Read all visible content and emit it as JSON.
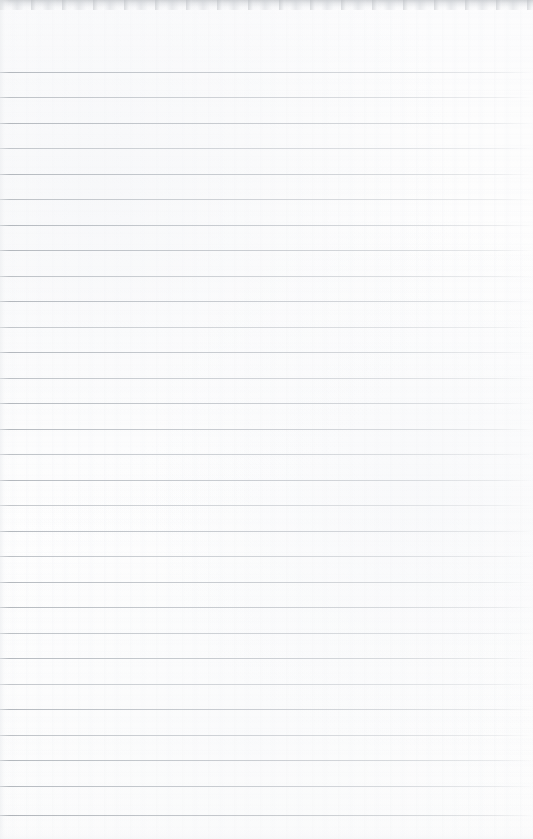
{
  "document": {
    "kind": "scanned-page",
    "subject": "blank ruled notebook paper",
    "width": 533,
    "height": 839,
    "has_text": false,
    "has_handwriting": false,
    "has_margin_rule": false,
    "has_page_number": false,
    "has_header": false,
    "has_footer": false,
    "text_content": ""
  },
  "colors": {
    "paper": "#fdfdfd",
    "rule_line": "#b6bac0",
    "rule_line_left": "#aaafb5",
    "rule_line_right": "#d2d5d9",
    "scan_edge_shadow": "#c4c7cb"
  },
  "ruling": {
    "line_count": 30,
    "first_line_y": 72,
    "last_line_y": 815,
    "spacing": 25.6,
    "thickness": 1,
    "starts_at_x": 0,
    "ends_at_x": 533,
    "fade_begins_x": 495,
    "orientation": "horizontal",
    "line_y_positions": [
      72,
      97,
      123,
      148,
      174,
      199,
      225,
      250,
      276,
      301,
      327,
      352,
      378,
      403,
      429,
      454,
      480,
      505,
      531,
      556,
      582,
      607,
      633,
      658,
      684,
      709,
      735,
      760,
      786,
      815
    ],
    "line_weights": [
      "normal",
      "light",
      "normal",
      "faint",
      "normal",
      "light",
      "normal",
      "normal",
      "light",
      "normal",
      "faint",
      "normal",
      "light",
      "normal",
      "normal",
      "light",
      "normal",
      "faint",
      "normal",
      "light",
      "normal",
      "normal",
      "light",
      "normal",
      "faint",
      "normal",
      "light",
      "normal",
      "normal",
      "strong"
    ]
  },
  "scan_artifacts": {
    "top_edge_shadow_height": 12,
    "top_edge_noise_height": 10,
    "left_edge_shadow_width": 10,
    "bottom_edge_shadow_height": 14,
    "paper_texture": "faint vertical banding with horizontal fibre grain",
    "skew": "negligible"
  }
}
